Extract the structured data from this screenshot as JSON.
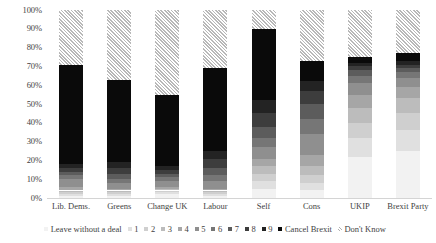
{
  "chart_data": {
    "type": "bar",
    "title": "",
    "subtitle": "",
    "xlabel": "",
    "ylabel": "",
    "ylim": [
      0,
      100
    ],
    "grid": false,
    "stacked": true,
    "stack_percent": true,
    "legend_position": "bottom",
    "categories": [
      "Lib. Dems.",
      "Greens",
      "Change UK",
      "Labour",
      "Self",
      "Cons",
      "UKIP",
      "Brexit Party"
    ],
    "ytick_labels": [
      "100%",
      "90%",
      "80%",
      "70%",
      "60%",
      "50%",
      "40%",
      "30%",
      "20%",
      "10%",
      "0%"
    ],
    "ytick_values": [
      100,
      90,
      80,
      70,
      60,
      50,
      40,
      30,
      20,
      10,
      0
    ],
    "series": [
      {
        "name": "Leave without a deal",
        "color": "#f2f2f2",
        "values": [
          1,
          1,
          2,
          1,
          5,
          4,
          22,
          25
        ]
      },
      {
        "name": "1",
        "color": "#e0e0e0",
        "values": [
          1,
          1,
          1,
          1,
          4,
          4,
          10,
          11
        ]
      },
      {
        "name": "2",
        "color": "#cfcfcf",
        "values": [
          1,
          1,
          1,
          1,
          4,
          4,
          8,
          9
        ]
      },
      {
        "name": "3",
        "color": "#bcbcbc",
        "values": [
          1,
          1,
          1,
          1,
          4,
          5,
          8,
          8
        ]
      },
      {
        "name": "4",
        "color": "#a6a6a6",
        "values": [
          2,
          1,
          1,
          1,
          4,
          6,
          7,
          6
        ]
      },
      {
        "name": "5",
        "color": "#8f8f8f",
        "values": [
          4,
          3,
          3,
          4,
          6,
          11,
          6,
          5
        ]
      },
      {
        "name": "6",
        "color": "#767676",
        "values": [
          2,
          2,
          2,
          3,
          5,
          8,
          4,
          3
        ]
      },
      {
        "name": "7",
        "color": "#5c5c5c",
        "values": [
          2,
          3,
          2,
          4,
          6,
          8,
          3,
          2
        ]
      },
      {
        "name": "8",
        "color": "#3d3d3d",
        "values": [
          2,
          3,
          2,
          5,
          7,
          7,
          2,
          2
        ]
      },
      {
        "name": "9",
        "color": "#232323",
        "values": [
          2,
          3,
          2,
          4,
          7,
          5,
          2,
          2
        ]
      },
      {
        "name": "Cancel Brexit",
        "color": "#0a0a0a",
        "values": [
          53,
          44,
          38,
          44,
          38,
          11,
          3,
          4
        ]
      },
      {
        "name": "Don't Know",
        "color": "#ffffff",
        "hatched": true,
        "values": [
          29,
          37,
          45,
          31,
          10,
          27,
          25,
          23
        ]
      }
    ]
  },
  "legend": {
    "items": [
      {
        "label": "Leave without a deal",
        "swatch": "legend-swatch-leave-without-a-deal"
      },
      {
        "label": "1",
        "swatch": "legend-swatch-1"
      },
      {
        "label": "2",
        "swatch": "legend-swatch-2"
      },
      {
        "label": "3",
        "swatch": "legend-swatch-3"
      },
      {
        "label": "4",
        "swatch": "legend-swatch-4"
      },
      {
        "label": "5",
        "swatch": "legend-swatch-5"
      },
      {
        "label": "6",
        "swatch": "legend-swatch-6"
      },
      {
        "label": "7",
        "swatch": "legend-swatch-7"
      },
      {
        "label": "8",
        "swatch": "legend-swatch-8"
      },
      {
        "label": "9",
        "swatch": "legend-swatch-9"
      },
      {
        "label": "Cancel Brexit",
        "swatch": "legend-swatch-cancel-brexit"
      },
      {
        "label": "Don't Know",
        "swatch": "legend-swatch-dont-know"
      }
    ]
  }
}
